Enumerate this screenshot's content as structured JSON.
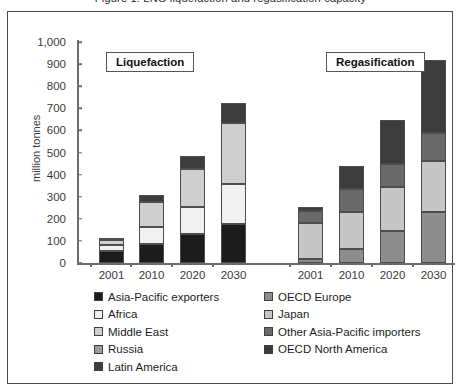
{
  "caption": "Figure 1: LNG liquefaction and regasification capacity",
  "chart_data": {
    "type": "bar",
    "title": "",
    "xlabel": "",
    "ylabel": "million tonnes",
    "ylim": [
      0,
      1000
    ],
    "ytick_values": [
      0,
      100,
      200,
      300,
      400,
      500,
      600,
      700,
      800,
      900,
      1000
    ],
    "ytick_labels": [
      "0",
      "100",
      "200",
      "300",
      "400",
      "500",
      "600",
      "700",
      "800",
      "900",
      "1,000"
    ],
    "grid": false,
    "stacked": true,
    "legend_position": "bottom",
    "groups": [
      {
        "name": "Liquefaction",
        "categories": [
          "2001",
          "2010",
          "2020",
          "2030"
        ],
        "series": [
          {
            "name": "Asia-Pacific exporters",
            "color": "#1c1c1c",
            "values": [
              55,
              85,
              130,
              178
            ]
          },
          {
            "name": "Africa",
            "color": "#f0f0f0",
            "values": [
              25,
              80,
              125,
              180
            ]
          },
          {
            "name": "Middle East",
            "color": "#cfcfcf",
            "values": [
              25,
              110,
              170,
              275
            ]
          },
          {
            "name": "Russia",
            "color": "#9a9a9a",
            "values": [
              0,
              0,
              0,
              0
            ]
          },
          {
            "name": "Latin America",
            "color": "#3d3d3d",
            "values": [
              10,
              35,
              60,
              90
            ]
          }
        ],
        "totals": [
          115,
          310,
          485,
          723
        ]
      },
      {
        "name": "Regasification",
        "categories": [
          "2001",
          "2010",
          "2020",
          "2030"
        ],
        "series": [
          {
            "name": "OECD Europe",
            "color": "#8d8d8d",
            "values": [
              20,
              65,
              145,
              232
            ]
          },
          {
            "name": "Japan",
            "color": "#c6c6c6",
            "values": [
              160,
              165,
              200,
              228
            ]
          },
          {
            "name": "Other Asia-Pacific importers",
            "color": "#6a6a6a",
            "values": [
              55,
              105,
              105,
              130
            ]
          },
          {
            "name": "OECD North America",
            "color": "#3d3d3d",
            "values": [
              20,
              105,
              195,
              330
            ]
          }
        ],
        "totals": [
          255,
          440,
          645,
          920
        ]
      }
    ],
    "legend": [
      {
        "label": "Asia-Pacific exporters",
        "color": "#1c1c1c"
      },
      {
        "label": "Africa",
        "color": "#f0f0f0"
      },
      {
        "label": "Middle East",
        "color": "#cfcfcf"
      },
      {
        "label": "Russia",
        "color": "#9a9a9a"
      },
      {
        "label": "Latin America",
        "color": "#3d3d3d"
      },
      {
        "label": "OECD Europe",
        "color": "#8d8d8d"
      },
      {
        "label": "Japan",
        "color": "#c6c6c6"
      },
      {
        "label": "Other Asia-Pacific importers",
        "color": "#6a6a6a"
      },
      {
        "label": "OECD North America",
        "color": "#3d3d3d"
      }
    ]
  }
}
